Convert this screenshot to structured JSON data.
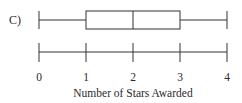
{
  "figure": {
    "option_label": "C)",
    "line_color": "#333333"
  },
  "chart_data": {
    "type": "boxplot",
    "title": "",
    "xlabel": "Number of Stars Awarded",
    "ylabel": "",
    "xlim": [
      0,
      4
    ],
    "ticks": [
      0,
      1,
      2,
      3,
      4
    ],
    "tick_labels": [
      "0",
      "1",
      "2",
      "3",
      "4"
    ],
    "grid": false,
    "legend": null,
    "box": {
      "min": 0,
      "q1": 1,
      "median": 2,
      "q3": 3,
      "max": 4
    }
  }
}
